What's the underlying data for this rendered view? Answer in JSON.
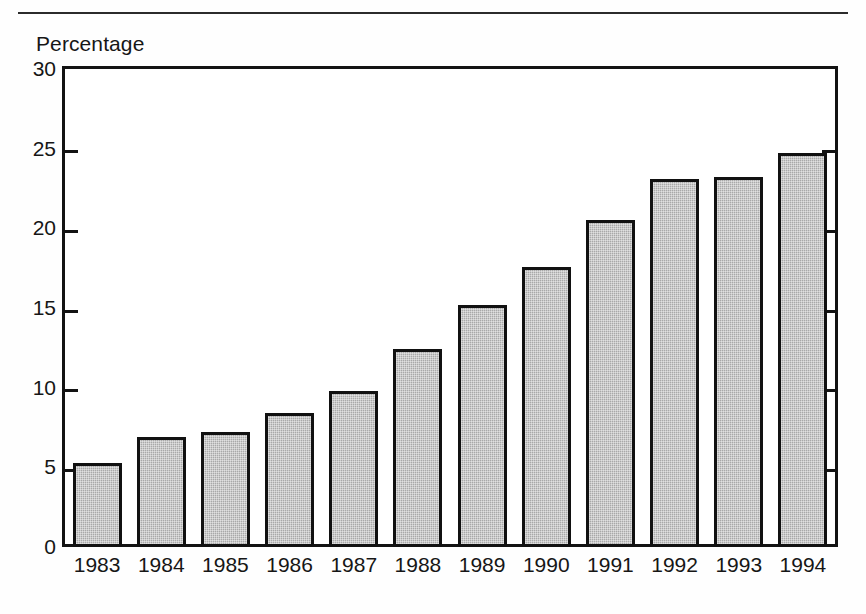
{
  "page": {
    "background_color": "#fefefe",
    "rule_color": "#2b2b2b"
  },
  "chart_data": {
    "type": "bar",
    "title": "",
    "subtitle": "",
    "xlabel": "",
    "ylabel": "Percentage",
    "categories": [
      "1983",
      "1984",
      "1985",
      "1986",
      "1987",
      "1988",
      "1989",
      "1990",
      "1991",
      "1992",
      "1993",
      "1994"
    ],
    "values": [
      5.3,
      6.9,
      7.2,
      8.4,
      9.8,
      12.4,
      15.2,
      17.6,
      20.5,
      23.1,
      23.2,
      24.7
    ],
    "ylim": [
      0,
      30
    ],
    "yticks": [
      0,
      5,
      10,
      15,
      20,
      25,
      30
    ],
    "ytick_labels": [
      "0",
      "5",
      "10",
      "15",
      "20",
      "25",
      "30"
    ],
    "grid": false,
    "legend": "none",
    "bar_fill_color": "#a9a9a9",
    "bar_border_color": "#111111",
    "axis_color": "#131313"
  }
}
